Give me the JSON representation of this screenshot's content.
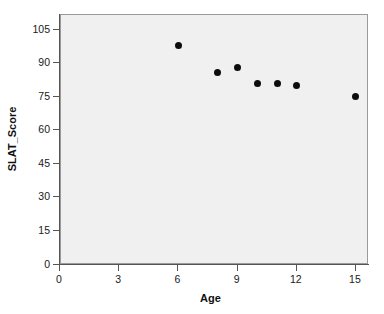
{
  "chart_data": {
    "type": "scatter",
    "title": "",
    "xlabel": "Age",
    "ylabel": "SLAT_Score",
    "xlim": [
      0,
      16.2
    ],
    "ylim": [
      0,
      111
    ],
    "xticks": [
      0,
      3,
      6,
      9,
      12,
      15
    ],
    "yticks": [
      0,
      15,
      30,
      45,
      60,
      75,
      90,
      105
    ],
    "xtick_labels": [
      "0",
      "3",
      "6",
      "9",
      "12",
      "15"
    ],
    "ytick_labels": [
      "0",
      "15",
      "30",
      "45",
      "60",
      "75",
      "90",
      "105"
    ],
    "grid": false,
    "legend": null,
    "marker": {
      "shape": "circle",
      "color": "#0d0d0d",
      "size_px": 7
    },
    "plot_background": "#f0f0f0",
    "page_background": "#ffffff",
    "axis_color": "#555555",
    "series": [
      {
        "name": "SLAT_Score vs Age",
        "x": [
          6,
          8,
          9,
          10,
          11,
          12,
          15
        ],
        "y": [
          98,
          86,
          88,
          81,
          81,
          80,
          75
        ],
        "points": [
          {
            "x": 6,
            "y": 98
          },
          {
            "x": 8,
            "y": 86
          },
          {
            "x": 9,
            "y": 88
          },
          {
            "x": 10,
            "y": 81
          },
          {
            "x": 11,
            "y": 81
          },
          {
            "x": 12,
            "y": 80
          },
          {
            "x": 15,
            "y": 75
          }
        ]
      }
    ]
  }
}
